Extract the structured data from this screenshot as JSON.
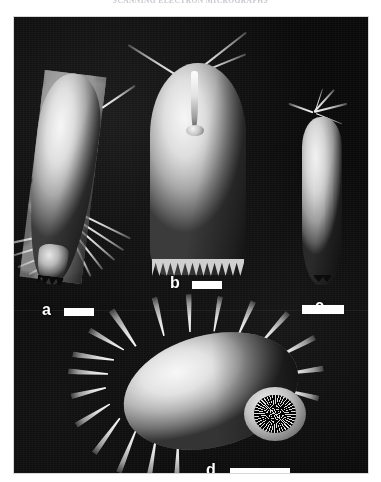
{
  "header": {
    "running_title": "SCANNING ELECTRON MICROGRAPHS"
  },
  "figure": {
    "background_color": "#080808",
    "plate_border_color": "#d8d8d8",
    "label_color": "#ffffff",
    "scale_bar_color": "#ffffff",
    "panels": [
      {
        "id": "a",
        "label": "a",
        "description": "Elongate tuberculate specimen in lateral view with long curved setae projecting from the posterior end",
        "scale_bar": {
          "length_px": 30,
          "thickness_px": 8
        }
      },
      {
        "id": "b",
        "label": "b",
        "description": "Large imbricate scaled cone-shaped specimen with a central apical process and serrated basal margin",
        "scale_bar": {
          "length_px": 30,
          "thickness_px": 8
        }
      },
      {
        "id": "c",
        "label": "c",
        "description": "Smooth elongate capsule with fine apical appendages",
        "scale_bar": {
          "length_px": 42,
          "thickness_px": 9
        }
      },
      {
        "id": "d",
        "label": "d",
        "description": "Ovoid spinose specimen in oblique view showing a dark circular terminal aperture lined with teeth",
        "scale_bar": {
          "length_px": 60,
          "thickness_px": 9
        }
      }
    ]
  }
}
